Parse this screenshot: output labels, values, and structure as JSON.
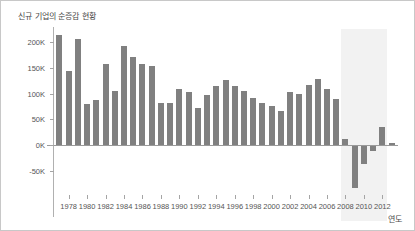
{
  "figure": {
    "background_color": "#ffffff",
    "border_color": "#c8c8c8"
  },
  "chart_data": {
    "type": "bar",
    "title": "신규 기업의 순증감 현황",
    "xlabel": "연도",
    "ylabel": "",
    "grid": false,
    "legend": null,
    "bar_color": "#808080",
    "highlight_band": {
      "from": 2007.5,
      "to": 2012.5,
      "color": "#f2f2f2",
      "label": ""
    },
    "ylim": [
      -100000,
      225000
    ],
    "ytick_values": [
      200000,
      150000,
      100000,
      50000,
      0,
      -50000
    ],
    "ytick_labels": [
      "200K",
      "150K",
      "100K",
      "50K",
      "0K",
      "-50K"
    ],
    "xlim": [
      1976.3,
      2013.7
    ],
    "xtick_values": [
      1978,
      1980,
      1982,
      1984,
      1986,
      1988,
      1990,
      1992,
      1994,
      1996,
      1998,
      2000,
      2002,
      2004,
      2006,
      2008,
      2010,
      2012
    ],
    "xtick_labels": [
      "1978",
      "1980",
      "1982",
      "1984",
      "1986",
      "1988",
      "1990",
      "1992",
      "1994",
      "1996",
      "1998",
      "2000",
      "2002",
      "2004",
      "2006",
      "2008",
      "2010",
      "2012"
    ],
    "categories": [
      1977,
      1978,
      1979,
      1980,
      1981,
      1982,
      1983,
      1984,
      1985,
      1986,
      1987,
      1988,
      1989,
      1990,
      1991,
      1992,
      1993,
      1994,
      1995,
      1996,
      1997,
      1998,
      1999,
      2000,
      2001,
      2002,
      2003,
      2004,
      2005,
      2006,
      2007,
      2008,
      2009,
      2010,
      2011,
      2012,
      2013
    ],
    "values": [
      213000,
      143000,
      205000,
      80000,
      88000,
      158000,
      105000,
      193000,
      171000,
      158000,
      154000,
      81000,
      81000,
      109000,
      103000,
      72000,
      97000,
      114000,
      126000,
      114000,
      106000,
      92000,
      81000,
      76000,
      66000,
      104000,
      99000,
      116000,
      128000,
      108000,
      89000,
      13000,
      -82000,
      -37000,
      -11000,
      35000,
      4000
    ]
  }
}
